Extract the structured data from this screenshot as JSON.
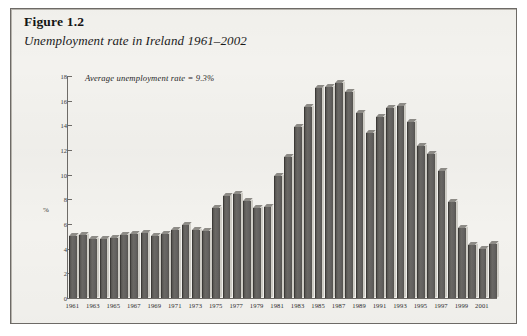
{
  "figure": {
    "label": "Figure 1.2",
    "caption": "Unemployment rate in Ireland 1961–2002"
  },
  "annotation": "Average unemployment rate = 9.3%",
  "axes": {
    "y_label": "%",
    "y_ticks": [
      "0",
      "2",
      "4",
      "6",
      "8",
      "10",
      "12",
      "14",
      "16",
      "18"
    ],
    "x_ticks": [
      "1961",
      "1963",
      "1965",
      "1967",
      "1969",
      "1971",
      "1973",
      "1975",
      "1977",
      "1979",
      "1981",
      "1983",
      "1985",
      "1987",
      "1989",
      "1991",
      "1993",
      "1995",
      "1997",
      "1999",
      "2001"
    ]
  },
  "chart_data": {
    "type": "bar",
    "title": "Unemployment rate in Ireland 1961–2002",
    "xlabel": "",
    "ylabel": "%",
    "ylim": [
      0,
      18
    ],
    "grid": false,
    "legend": "none",
    "annotations": [
      "Average unemployment rate = 9.3%"
    ],
    "average": 9.3,
    "categories": [
      "1961",
      "1962",
      "1963",
      "1964",
      "1965",
      "1966",
      "1967",
      "1968",
      "1969",
      "1970",
      "1971",
      "1972",
      "1973",
      "1974",
      "1975",
      "1976",
      "1977",
      "1978",
      "1979",
      "1980",
      "1981",
      "1982",
      "1983",
      "1984",
      "1985",
      "1986",
      "1987",
      "1988",
      "1989",
      "1990",
      "1991",
      "1992",
      "1993",
      "1994",
      "1995",
      "1996",
      "1997",
      "1998",
      "1999",
      "2000",
      "2001",
      "2002"
    ],
    "values": [
      5.0,
      5.1,
      4.8,
      4.8,
      4.9,
      5.1,
      5.2,
      5.3,
      5.0,
      5.2,
      5.5,
      5.9,
      5.5,
      5.4,
      7.3,
      8.3,
      8.4,
      7.9,
      7.3,
      7.4,
      9.9,
      11.4,
      13.9,
      15.5,
      17.0,
      17.1,
      17.4,
      16.7,
      15.0,
      13.4,
      14.7,
      15.4,
      15.6,
      14.3,
      12.3,
      11.7,
      10.3,
      7.8,
      5.7,
      4.3,
      4.0,
      4.4
    ],
    "series": [
      {
        "name": "Unemployment rate",
        "values": [
          5.0,
          5.1,
          4.8,
          4.8,
          4.9,
          5.1,
          5.2,
          5.3,
          5.0,
          5.2,
          5.5,
          5.9,
          5.5,
          5.4,
          7.3,
          8.3,
          8.4,
          7.9,
          7.3,
          7.4,
          9.9,
          11.4,
          13.9,
          15.5,
          17.0,
          17.1,
          17.4,
          16.7,
          15.0,
          13.4,
          14.7,
          15.4,
          15.6,
          14.3,
          12.3,
          11.7,
          10.3,
          7.8,
          5.7,
          4.3,
          4.0,
          4.4
        ]
      }
    ]
  },
  "colors": {
    "panel_background": "#f3f2ee",
    "panel_border": "#6d6a66",
    "bar_front": "#626060",
    "bar_side": "#cfcdc6",
    "bar_top": "#8e8c87",
    "axis": "#6f6c68"
  }
}
